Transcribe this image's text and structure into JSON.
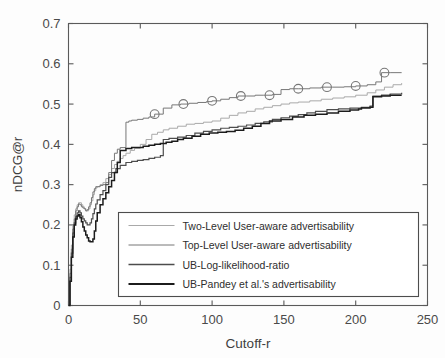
{
  "chart_data": {
    "type": "line",
    "title": "",
    "xlabel": "Cutoff-r",
    "ylabel": "nDCG@r",
    "xlim": [
      0,
      250
    ],
    "ylim": [
      0,
      0.7
    ],
    "xticks": [
      0,
      50,
      100,
      150,
      200,
      250
    ],
    "yticks": [
      0,
      0.1,
      0.2,
      0.3,
      0.4,
      0.5,
      0.6,
      0.7
    ],
    "xtick_labels": [
      "0",
      "50",
      "100",
      "150",
      "200",
      "250"
    ],
    "ytick_labels": [
      "0",
      "0.1",
      "0.2",
      "0.3",
      "0.4",
      "0.5",
      "0.6",
      "0.7"
    ],
    "grid": false,
    "legend_position": "lower-center",
    "colors": {
      "two_level": "#a9a9a9",
      "top_level": "#777777",
      "log_likelihood": "#4d4d4d",
      "pandey": "#1c1c1c",
      "axis": "#5a5a5a",
      "text": "#3f3f3f",
      "background": "#fdfdfd"
    },
    "series": [
      {
        "name": "Two-Level User-aware advertisability",
        "color": "#a9a9a9",
        "marker": "none",
        "x": [
          0,
          1,
          2,
          3,
          4,
          5,
          6,
          7,
          8,
          9,
          10,
          11,
          12,
          13,
          14,
          15,
          16,
          17,
          18,
          19,
          20,
          22,
          24,
          26,
          28,
          30,
          32,
          34,
          36,
          38,
          40,
          43,
          46,
          50,
          54,
          58,
          62,
          66,
          70,
          76,
          82,
          88,
          94,
          100,
          106,
          112,
          118,
          124,
          130,
          136,
          142,
          148,
          154,
          160,
          168,
          176,
          184,
          192,
          200,
          208,
          214,
          220,
          226,
          232
        ],
        "y": [
          0.0,
          0.09,
          0.15,
          0.2,
          0.225,
          0.24,
          0.25,
          0.255,
          0.255,
          0.25,
          0.245,
          0.24,
          0.235,
          0.235,
          0.24,
          0.25,
          0.26,
          0.275,
          0.285,
          0.292,
          0.295,
          0.3,
          0.305,
          0.315,
          0.325,
          0.34,
          0.35,
          0.358,
          0.365,
          0.372,
          0.378,
          0.385,
          0.39,
          0.4,
          0.412,
          0.425,
          0.43,
          0.436,
          0.44,
          0.445,
          0.45,
          0.452,
          0.455,
          0.458,
          0.465,
          0.472,
          0.478,
          0.482,
          0.488,
          0.492,
          0.496,
          0.5,
          0.503,
          0.505,
          0.508,
          0.512,
          0.515,
          0.518,
          0.522,
          0.528,
          0.535,
          0.542,
          0.548,
          0.552
        ]
      },
      {
        "name": "Top-Level User-aware advertisability",
        "color": "#777777",
        "marker": "circle",
        "marker_x": [
          60,
          80,
          100,
          120,
          140,
          160,
          180,
          200,
          220
        ],
        "marker_y": [
          0.475,
          0.5,
          0.508,
          0.52,
          0.522,
          0.538,
          0.542,
          0.545,
          0.578
        ],
        "x": [
          0,
          1,
          2,
          3,
          4,
          5,
          6,
          7,
          8,
          9,
          10,
          11,
          12,
          13,
          14,
          15,
          16,
          17,
          18,
          19,
          20,
          22,
          24,
          26,
          28,
          30,
          32,
          34,
          36,
          38,
          40,
          42,
          44,
          48,
          52,
          56,
          60,
          66,
          72,
          78,
          84,
          90,
          96,
          100,
          106,
          112,
          118,
          124,
          130,
          136,
          142,
          148,
          154,
          160,
          168,
          176,
          184,
          192,
          200,
          208,
          214,
          218,
          224,
          232
        ],
        "y": [
          0.0,
          0.08,
          0.14,
          0.19,
          0.215,
          0.235,
          0.245,
          0.252,
          0.25,
          0.245,
          0.242,
          0.24,
          0.235,
          0.238,
          0.245,
          0.255,
          0.268,
          0.282,
          0.29,
          0.295,
          0.295,
          0.298,
          0.3,
          0.305,
          0.33,
          0.36,
          0.378,
          0.388,
          0.392,
          0.392,
          0.455,
          0.458,
          0.46,
          0.462,
          0.465,
          0.468,
          0.475,
          0.49,
          0.498,
          0.5,
          0.502,
          0.504,
          0.506,
          0.508,
          0.512,
          0.516,
          0.52,
          0.52,
          0.522,
          0.522,
          0.524,
          0.536,
          0.538,
          0.538,
          0.54,
          0.542,
          0.542,
          0.543,
          0.545,
          0.548,
          0.555,
          0.578,
          0.578,
          0.578
        ]
      },
      {
        "name": "UB-Log-likelihood-ratio",
        "color": "#4d4d4d",
        "marker": "none",
        "x": [
          0,
          1,
          2,
          3,
          4,
          5,
          6,
          7,
          8,
          9,
          10,
          11,
          12,
          13,
          14,
          15,
          16,
          17,
          18,
          19,
          20,
          22,
          24,
          26,
          28,
          30,
          33,
          36,
          40,
          44,
          48,
          52,
          56,
          60,
          64,
          66,
          70,
          76,
          82,
          88,
          94,
          100,
          106,
          112,
          118,
          124,
          130,
          136,
          142,
          148,
          154,
          160,
          166,
          172,
          180,
          188,
          196,
          204,
          210,
          212,
          218,
          224,
          232
        ],
        "y": [
          0.0,
          0.07,
          0.13,
          0.18,
          0.205,
          0.22,
          0.23,
          0.235,
          0.23,
          0.222,
          0.215,
          0.21,
          0.205,
          0.2,
          0.2,
          0.205,
          0.215,
          0.228,
          0.24,
          0.252,
          0.262,
          0.275,
          0.285,
          0.3,
          0.318,
          0.33,
          0.34,
          0.348,
          0.355,
          0.358,
          0.36,
          0.362,
          0.365,
          0.368,
          0.372,
          0.412,
          0.415,
          0.418,
          0.422,
          0.428,
          0.432,
          0.436,
          0.44,
          0.442,
          0.445,
          0.448,
          0.452,
          0.456,
          0.462,
          0.466,
          0.47,
          0.474,
          0.478,
          0.482,
          0.486,
          0.488,
          0.49,
          0.492,
          0.495,
          0.52,
          0.522,
          0.525,
          0.528
        ]
      },
      {
        "name": "UB-Pandey et al.'s advertisability",
        "color": "#1c1c1c",
        "marker": "none",
        "x": [
          0,
          1,
          2,
          3,
          4,
          5,
          6,
          7,
          8,
          9,
          10,
          11,
          12,
          13,
          14,
          15,
          16,
          17,
          18,
          19,
          20,
          22,
          24,
          26,
          28,
          30,
          32,
          34,
          36,
          40,
          44,
          48,
          52,
          56,
          60,
          64,
          68,
          72,
          76,
          80,
          86,
          92,
          98,
          104,
          110,
          116,
          122,
          128,
          134,
          140,
          148,
          156,
          164,
          172,
          180,
          188,
          196,
          202,
          204,
          210,
          212,
          218,
          224,
          232
        ],
        "y": [
          0.0,
          0.06,
          0.12,
          0.17,
          0.2,
          0.215,
          0.222,
          0.225,
          0.218,
          0.208,
          0.195,
          0.185,
          0.175,
          0.168,
          0.16,
          0.158,
          0.158,
          0.165,
          0.185,
          0.21,
          0.23,
          0.25,
          0.265,
          0.28,
          0.295,
          0.31,
          0.33,
          0.355,
          0.385,
          0.39,
          0.392,
          0.392,
          0.395,
          0.398,
          0.4,
          0.402,
          0.405,
          0.408,
          0.412,
          0.415,
          0.42,
          0.425,
          0.428,
          0.43,
          0.432,
          0.435,
          0.44,
          0.445,
          0.452,
          0.458,
          0.462,
          0.468,
          0.472,
          0.475,
          0.478,
          0.482,
          0.485,
          0.488,
          0.49,
          0.492,
          0.518,
          0.52,
          0.522,
          0.522
        ]
      }
    ]
  },
  "legend": {
    "items": [
      {
        "label": "Two-Level User-aware advertisability",
        "color": "#a9a9a9"
      },
      {
        "label": "Top-Level User-aware advertisability",
        "color": "#777777"
      },
      {
        "label": "UB-Log-likelihood-ratio",
        "color": "#4d4d4d"
      },
      {
        "label": "UB-Pandey et al.'s advertisability",
        "color": "#1c1c1c"
      }
    ]
  }
}
